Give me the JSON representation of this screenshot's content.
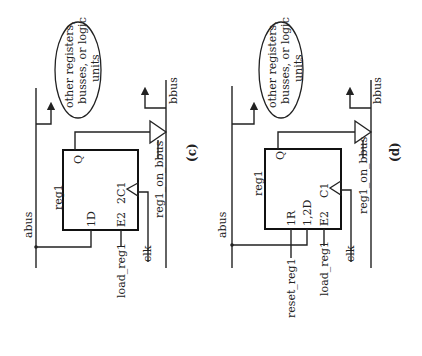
{
  "diagrams": [
    {
      "caption": "(c)",
      "register_name": "reg1",
      "input_bus": "abus",
      "output_bus": "bbus",
      "ellipse_text": [
        "other registers,",
        "busses, or logic",
        "units"
      ],
      "pins": {
        "output": "Q",
        "data": "1D",
        "enable": "E2",
        "clock": "2C1"
      },
      "signals": {
        "load": "load_reg1",
        "clock": "clk",
        "tristate": "reg1_on_bbus"
      }
    },
    {
      "caption": "(d)",
      "register_name": "reg1",
      "input_bus": "abus",
      "output_bus": "bbus",
      "ellipse_text": [
        "other registers,",
        "busses, or logic",
        "units"
      ],
      "pins": {
        "output": "Q",
        "reset": "1R",
        "data": "1,2D",
        "enable": "E2",
        "clock": "C1"
      },
      "signals": {
        "reset": "reset_reg1",
        "load": "load_reg1",
        "clock": "clk",
        "tristate": "reg1_on_bbus"
      }
    }
  ]
}
